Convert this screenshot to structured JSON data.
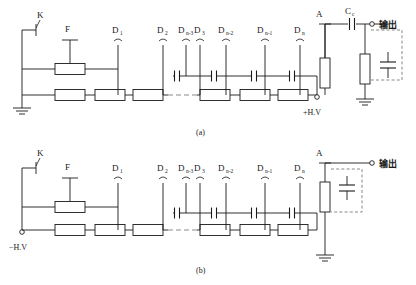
{
  "figure": {
    "panels": [
      {
        "id": "a",
        "caption": "(a)",
        "polarity_label": "+H.V",
        "ground_side": "cathode",
        "labels": {
          "switch": "K",
          "focus": "F",
          "anode": "A",
          "coupling_cap": "C",
          "coupling_cap_sub": "c",
          "output": "输出"
        },
        "dynodes": [
          {
            "base": "D",
            "sub": "1"
          },
          {
            "base": "D",
            "sub": "2"
          },
          {
            "base": "D",
            "sub": "3"
          },
          {
            "base": "D",
            "sub": "n-3"
          },
          {
            "base": "D",
            "sub": "n-2"
          },
          {
            "base": "D",
            "sub": "n-1"
          },
          {
            "base": "D",
            "sub": "n"
          }
        ],
        "resistor_count": 8,
        "capacitor_count": 4,
        "has_coupling_capacitor": true,
        "has_dashed_load_capacitor": true,
        "has_output_ground": true
      },
      {
        "id": "b",
        "caption": "(b)",
        "polarity_label": "−H.V",
        "ground_side": "anode",
        "labels": {
          "switch": "K",
          "focus": "F",
          "anode": "A",
          "output": "输出"
        },
        "dynodes": [
          {
            "base": "D",
            "sub": "1"
          },
          {
            "base": "D",
            "sub": "2"
          },
          {
            "base": "D",
            "sub": "3"
          },
          {
            "base": "D",
            "sub": "n-3"
          },
          {
            "base": "D",
            "sub": "n-2"
          },
          {
            "base": "D",
            "sub": "n-1"
          },
          {
            "base": "D",
            "sub": "n"
          }
        ],
        "resistor_count": 8,
        "capacitor_count": 4,
        "has_coupling_capacitor": false,
        "has_dashed_load_capacitor": true,
        "has_output_ground": true
      }
    ],
    "colors": {
      "line": "#1a1a1a",
      "dashed": "#8a8a8a",
      "background": "#ffffff"
    }
  }
}
